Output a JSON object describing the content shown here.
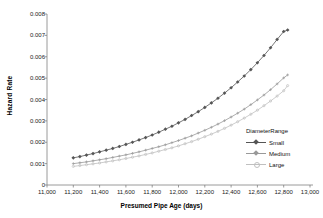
{
  "chart_data": {
    "type": "line",
    "title": "",
    "xlabel": "Presumed Pipe Age (days)",
    "ylabel": "Hazard Rate",
    "xlim": [
      11000,
      13000
    ],
    "ylim": [
      0,
      0.008
    ],
    "xticks": [
      "11,000",
      "11,200",
      "11,400",
      "11,600",
      "11,800",
      "12,000",
      "12,200",
      "12,400",
      "12,600",
      "12,800",
      "13,000"
    ],
    "xtick_values": [
      11000,
      11200,
      11400,
      11600,
      11800,
      12000,
      12200,
      12400,
      12600,
      12800,
      13000
    ],
    "yticks": [
      "0",
      "0.001",
      "0.002",
      "0.003",
      "0.004",
      "0.005",
      "0.006",
      "0.007",
      "0.008"
    ],
    "ytick_values": [
      0,
      0.001,
      0.002,
      0.003,
      0.004,
      0.005,
      0.006,
      0.007,
      0.008
    ],
    "grid": false,
    "legend": {
      "title": "DiameterRange",
      "position": "lower-right",
      "entries": [
        "Small",
        "Medium",
        "Large"
      ]
    },
    "x": [
      11200,
      11250,
      11300,
      11350,
      11400,
      11450,
      11500,
      11550,
      11600,
      11650,
      11700,
      11750,
      11800,
      11850,
      11900,
      11950,
      12000,
      12050,
      12100,
      12150,
      12200,
      12250,
      12300,
      12350,
      12400,
      12450,
      12500,
      12550,
      12600,
      12650,
      12700,
      12750,
      12800,
      12830
    ],
    "series": [
      {
        "name": "Small",
        "color": "#555555",
        "marker": "diamond",
        "values": [
          0.00127,
          0.00133,
          0.0014,
          0.00147,
          0.00155,
          0.00163,
          0.00171,
          0.0018,
          0.0019,
          0.002,
          0.00211,
          0.00222,
          0.00234,
          0.00247,
          0.00261,
          0.00275,
          0.00291,
          0.00307,
          0.00325,
          0.00343,
          0.00363,
          0.00384,
          0.00406,
          0.0043,
          0.00455,
          0.00482,
          0.0051,
          0.0054,
          0.00572,
          0.00606,
          0.00642,
          0.00681,
          0.00718,
          0.00725
        ]
      },
      {
        "name": "Medium",
        "color": "#999999",
        "marker": "plus",
        "values": [
          0.001,
          0.00104,
          0.00108,
          0.00113,
          0.00118,
          0.00123,
          0.00129,
          0.00135,
          0.00141,
          0.00148,
          0.00155,
          0.00163,
          0.00171,
          0.00179,
          0.00188,
          0.00198,
          0.00208,
          0.00219,
          0.0023,
          0.00243,
          0.00256,
          0.0027,
          0.00285,
          0.00301,
          0.00318,
          0.00336,
          0.00355,
          0.00376,
          0.00398,
          0.00421,
          0.00446,
          0.00473,
          0.00501,
          0.00515
        ]
      },
      {
        "name": "Large",
        "color": "#c0c0c0",
        "marker": "dot",
        "values": [
          0.00087,
          0.00091,
          0.00095,
          0.00099,
          0.00103,
          0.00108,
          0.00113,
          0.00118,
          0.00124,
          0.0013,
          0.00136,
          0.00143,
          0.0015,
          0.00158,
          0.00166,
          0.00174,
          0.00183,
          0.00193,
          0.00203,
          0.00214,
          0.00226,
          0.00238,
          0.00251,
          0.00265,
          0.0028,
          0.00296,
          0.00313,
          0.00331,
          0.0035,
          0.00371,
          0.00393,
          0.00416,
          0.00441,
          0.00465
        ]
      }
    ]
  }
}
